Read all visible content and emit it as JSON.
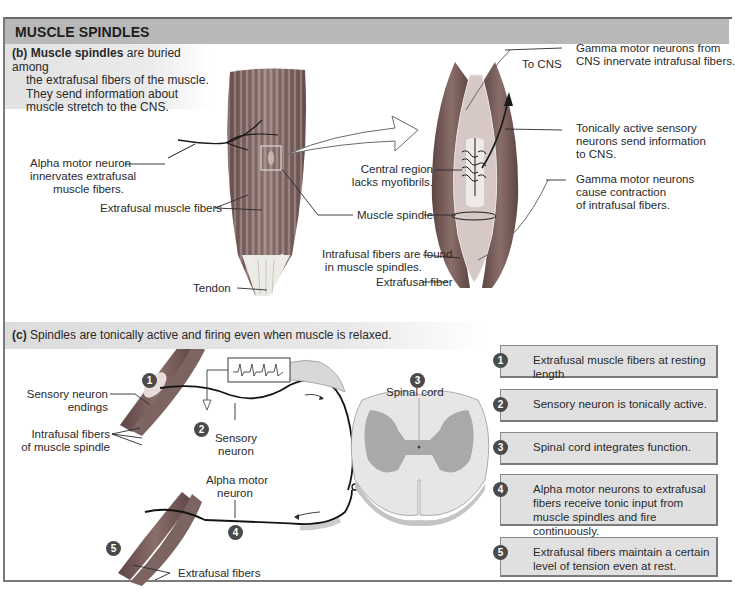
{
  "header": {
    "title": "MUSCLE SPINDLES"
  },
  "panel_b": {
    "caption_label": "(b)",
    "caption_bold": "Muscle spindles",
    "caption_lines": [
      "are buried among",
      "the extrafusal fibers of the muscle.",
      "They send information about",
      "muscle stretch to the CNS."
    ],
    "labels": {
      "alpha_motor_1": "Alpha motor neuron",
      "alpha_motor_2": "innervates extrafusal",
      "alpha_motor_3": "muscle fibers.",
      "extrafusal_fibers": "Extrafusal muscle fibers",
      "tendon": "Tendon",
      "central_region_1": "Central region",
      "central_region_2": "lacks myofibrils.",
      "muscle_spindle": "Muscle spindle",
      "intrafusal_1": "Intrafusal fibers are found",
      "intrafusal_2": "in muscle spindles.",
      "extrafusal_fiber": "Extrafusal fiber",
      "to_cns": "To CNS",
      "gamma_from_1": "Gamma motor neurons from",
      "gamma_from_2": "CNS innervate intrafusal fibers.",
      "tonic_1": "Tonically active sensory",
      "tonic_2": "neurons send information",
      "tonic_3": "to CNS.",
      "gamma_cause_1": "Gamma motor neurons",
      "gamma_cause_2": "cause contraction",
      "gamma_cause_3": "of intrafusal fibers."
    }
  },
  "panel_c": {
    "caption_label": "(c)",
    "caption_text": "Spindles are tonically active and firing even when muscle is relaxed.",
    "labels": {
      "sensory_endings_1": "Sensory neuron",
      "sensory_endings_2": "endings",
      "intrafusal_1": "Intrafusal fibers",
      "intrafusal_2": "of muscle spindle",
      "sensory_neuron_1": "Sensory",
      "sensory_neuron_2": "neuron",
      "spinal_cord": "Spinal cord",
      "alpha_motor_1": "Alpha motor",
      "alpha_motor_2": "neuron",
      "extrafusal_fibers": "Extrafusal fibers"
    },
    "markers": [
      "1",
      "2",
      "3",
      "4",
      "5"
    ],
    "steps": [
      {
        "num": "1",
        "text": "Extrafusal muscle fibers at resting length"
      },
      {
        "num": "2",
        "text": "Sensory neuron is tonically active."
      },
      {
        "num": "3",
        "text": "Spinal cord integrates function."
      },
      {
        "num": "4",
        "text": "Alpha motor neurons to extrafusal fibers receive tonic input from muscle spindles and fire continuously."
      },
      {
        "num": "5",
        "text": "Extrafusal fibers maintain a certain level of tension even at rest."
      }
    ]
  },
  "colors": {
    "header_bg": "#b8b8b8",
    "caption_bg": "#e2e2e2",
    "step_bg": "#e0e0e0",
    "badge": "#4a4a4a",
    "muscle_dark": "#6e5450",
    "muscle_mid": "#8c7470",
    "spinal_white": "#e6e6e6",
    "spinal_gray": "#a8a8a8"
  }
}
